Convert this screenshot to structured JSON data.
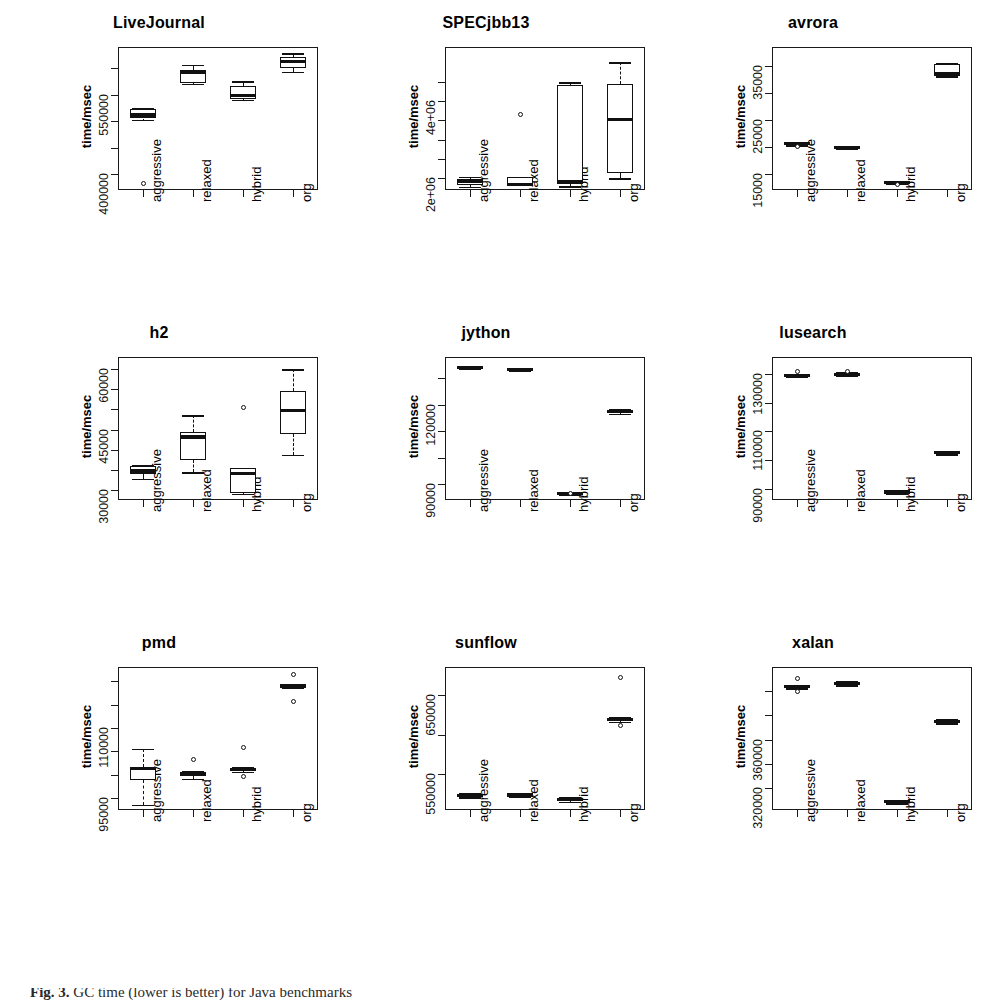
{
  "figure": {
    "caption_label": "Fig. 3.",
    "caption_text": "GC time (lower is better) for Java benchmarks",
    "ylabel": "time/msec",
    "categories": [
      "aggressive",
      "relaxed",
      "hybrid",
      "org"
    ]
  },
  "chart_data": {
    "type": "box",
    "title": "",
    "xlabel": "",
    "ylabel": "time/msec",
    "categories": [
      "aggressive",
      "relaxed",
      "hybrid",
      "org"
    ],
    "panels": [
      {
        "name": "LiveJournal",
        "ylim": [
          370000,
          640000
        ],
        "yticks": [
          400000,
          550000
        ],
        "ytick_labels": [
          "400000",
          "550000"
        ],
        "minor_ticks": [
          400000,
          450000,
          500000,
          550000,
          600000
        ],
        "boxes": [
          {
            "category": "aggressive",
            "min": 503000,
            "q1": 505000,
            "median": 512000,
            "q3": 523000,
            "max": 524000,
            "outliers": [
              382000
            ]
          },
          {
            "category": "relaxed",
            "min": 570000,
            "q1": 572000,
            "median": 592000,
            "q3": 596000,
            "max": 606000,
            "outliers": []
          },
          {
            "category": "hybrid",
            "min": 540000,
            "q1": 541000,
            "median": 549000,
            "q3": 566000,
            "max": 575000,
            "outliers": []
          },
          {
            "category": "org",
            "min": 593000,
            "q1": 600000,
            "median": 613000,
            "q3": 621000,
            "max": 628000,
            "outliers": []
          }
        ]
      },
      {
        "name": "SPECjbb13",
        "ylim": [
          1700000,
          5400000
        ],
        "yticks": [
          2000000,
          4000000
        ],
        "ytick_labels": [
          "2e+06",
          "4e+06"
        ],
        "minor_ticks": [
          2000000,
          2500000,
          3000000,
          3500000,
          4000000,
          4500000
        ],
        "boxes": [
          {
            "category": "aggressive",
            "min": 1790000,
            "q1": 1840000,
            "median": 1940000,
            "q3": 1970000,
            "max": 2040000,
            "outliers": []
          },
          {
            "category": "relaxed",
            "min": 1800000,
            "q1": 1810000,
            "median": 1840000,
            "q3": 2030000,
            "max": 2030000,
            "outliers": [
              3650000
            ]
          },
          {
            "category": "hybrid",
            "min": 1800000,
            "q1": 1860000,
            "median": 1930000,
            "q3": 4420000,
            "max": 4490000,
            "outliers": []
          },
          {
            "category": "org",
            "min": 2000000,
            "q1": 2150000,
            "median": 3520000,
            "q3": 4450000,
            "max": 5000000,
            "outliers": []
          }
        ]
      },
      {
        "name": "avrora",
        "ylim": [
          12000,
          38500
        ],
        "yticks": [
          15000,
          25000,
          35000
        ],
        "ytick_labels": [
          "15000",
          "25000",
          "35000"
        ],
        "minor_ticks": [
          15000,
          20000,
          25000,
          30000,
          35000
        ],
        "boxes": [
          {
            "category": "aggressive",
            "min": 20300,
            "q1": 20400,
            "median": 20600,
            "q3": 20700,
            "max": 20800,
            "outliers": [
              20100
            ]
          },
          {
            "category": "relaxed",
            "min": 19600,
            "q1": 19700,
            "median": 19900,
            "q3": 20000,
            "max": 20100,
            "outliers": []
          },
          {
            "category": "hybrid",
            "min": 13200,
            "q1": 13300,
            "median": 13450,
            "q3": 13550,
            "max": 13650,
            "outliers": [
              13100
            ]
          },
          {
            "category": "org",
            "min": 33100,
            "q1": 33300,
            "median": 33500,
            "q3": 35400,
            "max": 35500,
            "outliers": []
          }
        ]
      },
      {
        "name": "h2",
        "ylim": [
          27500,
          63000
        ],
        "yticks": [
          30000,
          45000,
          60000
        ],
        "ytick_labels": [
          "30000",
          "45000",
          "60000"
        ],
        "minor_ticks": [
          30000,
          35000,
          40000,
          45000,
          50000,
          55000,
          60000
        ],
        "boxes": [
          {
            "category": "aggressive",
            "min": 32700,
            "q1": 34000,
            "median": 34700,
            "q3": 35900,
            "max": 36200,
            "outliers": []
          },
          {
            "category": "relaxed",
            "min": 34400,
            "q1": 37500,
            "median": 43200,
            "q3": 44300,
            "max": 48500,
            "outliers": []
          },
          {
            "category": "hybrid",
            "min": 29000,
            "q1": 29200,
            "median": 34100,
            "q3": 35400,
            "max": 35500,
            "outliers": [
              50500
            ]
          },
          {
            "category": "org",
            "min": 38700,
            "q1": 43800,
            "median": 49800,
            "q3": 54500,
            "max": 59900,
            "outliers": []
          }
        ]
      },
      {
        "name": "jython",
        "ylim": [
          84000,
          138000
        ],
        "yticks": [
          90000,
          120000
        ],
        "ytick_labels": [
          "90000",
          "120000"
        ],
        "minor_ticks": [
          90000,
          100000,
          110000,
          120000,
          130000
        ],
        "boxes": [
          {
            "category": "aggressive",
            "min": 133500,
            "q1": 133800,
            "median": 134100,
            "q3": 134400,
            "max": 134700,
            "outliers": []
          },
          {
            "category": "relaxed",
            "min": 132800,
            "q1": 133100,
            "median": 133400,
            "q3": 133700,
            "max": 134000,
            "outliers": []
          },
          {
            "category": "hybrid",
            "min": 86200,
            "q1": 86400,
            "median": 86600,
            "q3": 86800,
            "max": 87000,
            "outliers": [
              86300
            ]
          },
          {
            "category": "org",
            "min": 116500,
            "q1": 116900,
            "median": 117400,
            "q3": 117900,
            "max": 118300,
            "outliers": []
          }
        ]
      },
      {
        "name": "lusearch",
        "ylim": [
          86000,
          136000
        ],
        "yticks": [
          90000,
          110000,
          130000
        ],
        "ytick_labels": [
          "90000",
          "110000",
          "130000"
        ],
        "minor_ticks": [
          90000,
          100000,
          110000,
          120000,
          130000
        ],
        "boxes": [
          {
            "category": "aggressive",
            "min": 129000,
            "q1": 129300,
            "median": 129600,
            "q3": 129900,
            "max": 130200,
            "outliers": [
              130800
            ]
          },
          {
            "category": "relaxed",
            "min": 129400,
            "q1": 129700,
            "median": 130000,
            "q3": 130300,
            "max": 130600,
            "outliers": [
              131000
            ]
          },
          {
            "category": "hybrid",
            "min": 88400,
            "q1": 88600,
            "median": 88800,
            "q3": 89000,
            "max": 89200,
            "outliers": []
          },
          {
            "category": "org",
            "min": 102000,
            "q1": 102300,
            "median": 102600,
            "q3": 102900,
            "max": 103200,
            "outliers": []
          }
        ]
      },
      {
        "name": "pmd",
        "ylim": [
          92500,
          123000
        ],
        "yticks": [
          95000,
          110000
        ],
        "ytick_labels": [
          "95000",
          "110000"
        ],
        "minor_ticks": [
          95000,
          100000,
          105000,
          110000,
          115000,
          120000
        ],
        "boxes": [
          {
            "category": "aggressive",
            "min": 93600,
            "q1": 98800,
            "median": 101400,
            "q3": 101700,
            "max": 105500,
            "outliers": []
          },
          {
            "category": "relaxed",
            "min": 99200,
            "q1": 99700,
            "median": 100100,
            "q3": 100500,
            "max": 100800,
            "outliers": [
              103300
            ]
          },
          {
            "category": "hybrid",
            "min": 100700,
            "q1": 100900,
            "median": 101200,
            "q3": 101500,
            "max": 101700,
            "outliers": [
              105800,
              99700
            ]
          },
          {
            "category": "org",
            "min": 118600,
            "q1": 118800,
            "median": 119000,
            "q3": 119200,
            "max": 119400,
            "outliers": [
              121500,
              115600
            ]
          }
        ]
      },
      {
        "name": "sunflow",
        "ylim": [
          505000,
          685000
        ],
        "yticks": [
          550000,
          650000
        ],
        "ytick_labels": [
          "550000",
          "650000"
        ],
        "minor_ticks": [
          550000,
          600000,
          650000
        ],
        "boxes": [
          {
            "category": "aggressive",
            "min": 521000,
            "q1": 522000,
            "median": 523500,
            "q3": 525000,
            "max": 526000,
            "outliers": []
          },
          {
            "category": "relaxed",
            "min": 521500,
            "q1": 522500,
            "median": 524000,
            "q3": 525500,
            "max": 526500,
            "outliers": []
          },
          {
            "category": "hybrid",
            "min": 515000,
            "q1": 516500,
            "median": 518000,
            "q3": 519500,
            "max": 521000,
            "outliers": []
          },
          {
            "category": "org",
            "min": 616000,
            "q1": 617500,
            "median": 619000,
            "q3": 620500,
            "max": 622000,
            "outliers": [
              672000,
              611000
            ]
          }
        ]
      },
      {
        "name": "xalan",
        "ylim": [
          302000,
          420000
        ],
        "yticks": [
          320000,
          360000
        ],
        "ytick_labels": [
          "320000",
          "360000"
        ],
        "minor_ticks": [
          320000,
          340000,
          360000,
          380000,
          400000
        ],
        "boxes": [
          {
            "category": "aggressive",
            "min": 402500,
            "q1": 403200,
            "median": 404000,
            "q3": 404800,
            "max": 405500,
            "outliers": [
              410500,
              400000
            ]
          },
          {
            "category": "relaxed",
            "min": 405000,
            "q1": 405800,
            "median": 406600,
            "q3": 407400,
            "max": 408200,
            "outliers": []
          },
          {
            "category": "hybrid",
            "min": 307500,
            "q1": 308200,
            "median": 309000,
            "q3": 309800,
            "max": 310500,
            "outliers": []
          },
          {
            "category": "org",
            "min": 373500,
            "q1": 374300,
            "median": 375200,
            "q3": 376000,
            "max": 376800,
            "outliers": []
          }
        ]
      }
    ]
  }
}
